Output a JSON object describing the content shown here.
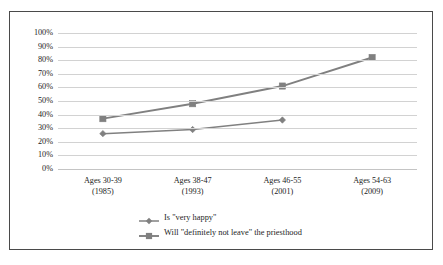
{
  "chart_data": {
    "type": "line",
    "title": "",
    "xlabel": "",
    "ylabel": "",
    "ylim": [
      0,
      100
    ],
    "grid": true,
    "legend_position": "bottom",
    "categories": [
      "Ages 30-39\n(1985)",
      "Ages 38-47\n(1993)",
      "Ages 46-55\n(2001)",
      "Ages 54-63\n(2009)"
    ],
    "category_lines": [
      {
        "age": "Ages 30-39",
        "year": "(1985)"
      },
      {
        "age": "Ages 38-47",
        "year": "(1993)"
      },
      {
        "age": "Ages 46-55",
        "year": "(2001)"
      },
      {
        "age": "Ages 54-63",
        "year": "(2009)"
      }
    ],
    "ytick_labels": [
      "100%",
      "90%",
      "80%",
      "70%",
      "60%",
      "50%",
      "40%",
      "30%",
      "20%",
      "10%",
      "0%"
    ],
    "ytick_values": [
      100,
      90,
      80,
      70,
      60,
      50,
      40,
      30,
      20,
      10,
      0
    ],
    "series": [
      {
        "name": "Is \"very happy\"",
        "marker": "diamond",
        "color": "#808080",
        "values": [
          26,
          29,
          36,
          null
        ]
      },
      {
        "name": "Will \"definitely not leave\" the priesthood",
        "marker": "square",
        "color": "#808080",
        "values": [
          37,
          48,
          61,
          82
        ]
      }
    ]
  },
  "colors": {
    "series_line": "#808080",
    "gridline": "#d2d2d2",
    "frame_border": "#4a4a4a",
    "text": "#1d1d1d",
    "background": "#ffffff"
  }
}
